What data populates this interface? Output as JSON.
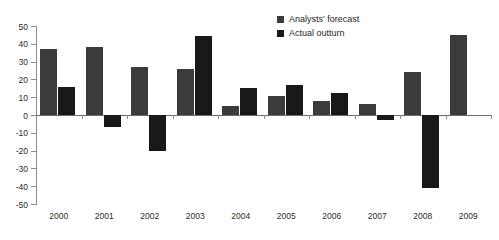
{
  "chart_data": {
    "type": "bar",
    "title": "",
    "subtitle": "",
    "xlabel": "",
    "ylabel": "",
    "categories": [
      "2000",
      "2001",
      "2002",
      "2003",
      "2004",
      "2005",
      "2006",
      "2007",
      "2008",
      "2009"
    ],
    "series": [
      {
        "name": "Analysts' forecast",
        "color": "#3b3b3b",
        "values": [
          37,
          38,
          27,
          26,
          5,
          10.5,
          8,
          6,
          24,
          45
        ]
      },
      {
        "name": "Actual outturn",
        "color": "#181818",
        "values": [
          16,
          -7,
          -20,
          44.5,
          15,
          17,
          12.5,
          -3,
          -41,
          null
        ]
      }
    ],
    "ylim": [
      -50,
      50
    ],
    "yticks": [
      50,
      40,
      30,
      20,
      10,
      0,
      -10,
      -20,
      -30,
      -40,
      -50
    ],
    "ytick_labels": [
      "50",
      "40",
      "30",
      "20",
      "10",
      "0",
      "-10",
      "-20",
      "-30",
      "-40",
      "-50"
    ],
    "grid": false,
    "legend_position": "top-center"
  }
}
